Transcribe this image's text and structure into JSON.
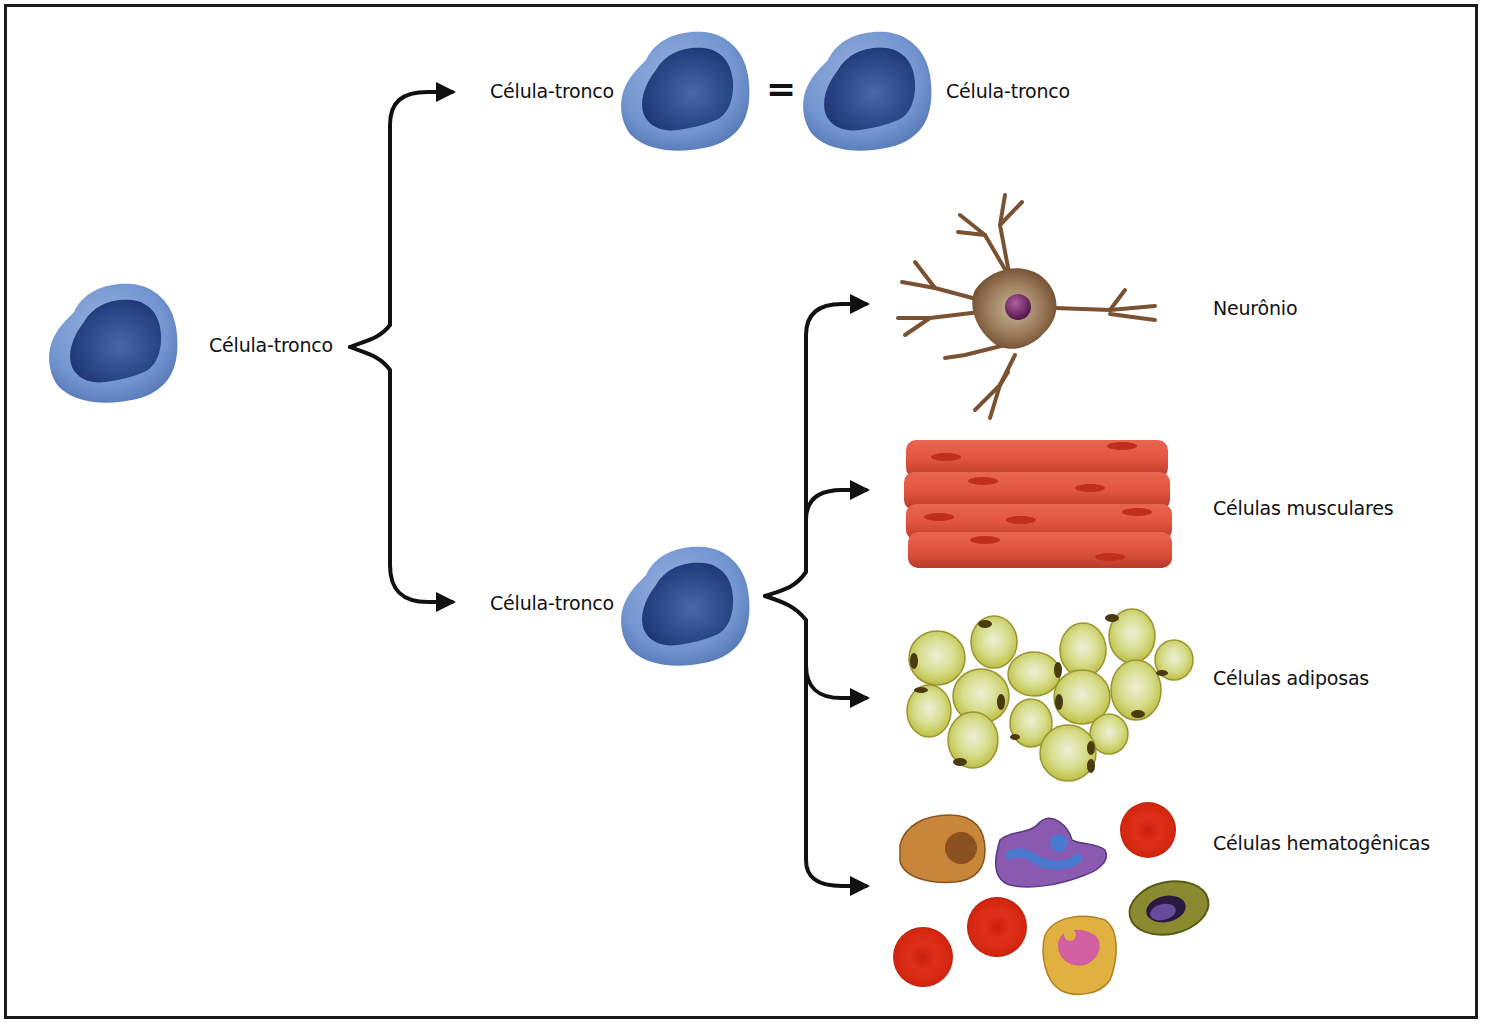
{
  "diagram": {
    "root": {
      "label": "Célula-tronco",
      "type": "stem-cell"
    },
    "self_renewal": {
      "left_label": "Célula-tronco",
      "equals_symbol": "=",
      "right_label": "Célula-tronco"
    },
    "differentiating": {
      "label": "Célula-tronco"
    },
    "outcomes": [
      {
        "label": "Neurônio",
        "type": "neuron"
      },
      {
        "label": "Células musculares",
        "type": "muscle-cells"
      },
      {
        "label": "Células adiposas",
        "type": "adipose-cells"
      },
      {
        "label": "Células hematogênicas",
        "type": "blood-cells"
      }
    ],
    "colors": {
      "stem_cytoplasm": "#6f90cc",
      "stem_nucleus": "#22407e",
      "arrow": "#111111",
      "neuron_body": "#8a6240",
      "neuron_nucleus": "#7a2a6a",
      "muscle": "#e0503a",
      "muscle_nucleus": "#c03020",
      "adipose": "#c8c845",
      "red_blood_cell": "#d62410"
    }
  }
}
